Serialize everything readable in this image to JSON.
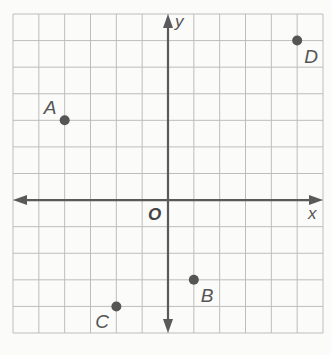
{
  "figure": {
    "type": "coordinate-plane",
    "x_axis_label": "x",
    "y_axis_label": "y",
    "origin_label": "O",
    "grid": {
      "x_min": -6,
      "x_max": 6,
      "y_min": -5,
      "y_max": 7,
      "step": 1,
      "line_color": "#bdbdbd",
      "axis_color": "#5a5a5a",
      "point_color": "#555555",
      "label_color": "#555555"
    },
    "points": [
      {
        "label": "A",
        "x": -4,
        "y": 3,
        "label_pos": "upper-left"
      },
      {
        "label": "B",
        "x": 1,
        "y": -3,
        "label_pos": "lower-right"
      },
      {
        "label": "C",
        "x": -2,
        "y": -4,
        "label_pos": "lower-left"
      },
      {
        "label": "D",
        "x": 5,
        "y": 6,
        "label_pos": "lower-right"
      }
    ]
  }
}
